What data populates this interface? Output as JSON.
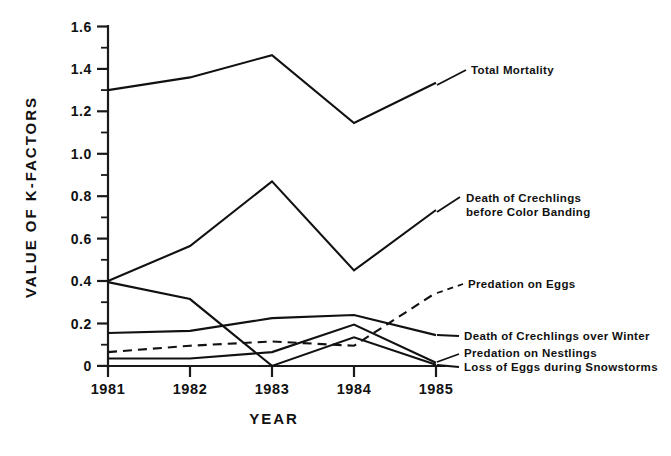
{
  "chart_data": {
    "type": "line",
    "title": "",
    "xlabel": "YEAR",
    "ylabel": "VALUE OF K-FACTORS",
    "categories": [
      "1981",
      "1982",
      "1983",
      "1984",
      "1985"
    ],
    "x": [
      1981,
      1982,
      1983,
      1984,
      1985
    ],
    "xlim": [
      1981,
      1985
    ],
    "ylim": [
      0,
      1.6
    ],
    "y_major_ticks": [
      "0",
      "0.2",
      "0.4",
      "0.6",
      "0.8",
      "1.0",
      "1.2",
      "1.4",
      "1.6"
    ],
    "y_major_values": [
      0,
      0.2,
      0.4,
      0.6,
      0.8,
      1.0,
      1.2,
      1.4,
      1.6
    ],
    "y_minor_values": [
      0.1,
      0.3,
      0.5,
      0.7,
      0.9,
      1.1,
      1.3,
      1.5
    ],
    "grid": false,
    "legend_position": "right-inline-annotations",
    "series": [
      {
        "name": "Total Mortality",
        "style": "solid",
        "label": "Total Mortality",
        "values": [
          1.3,
          1.36,
          1.465,
          1.145,
          1.335
        ]
      },
      {
        "name": "Death of Crechlings before Color Banding",
        "style": "solid",
        "label": "Death of Crechlings\nbefore Color Banding",
        "label_line1": "Death of Crechlings",
        "label_line2": "before Color Banding",
        "values": [
          0.4,
          0.565,
          0.87,
          0.45,
          0.735
        ]
      },
      {
        "name": "Loss of Eggs during Snowstorms",
        "style": "solid",
        "label": "Loss of Eggs during Snowstorms",
        "values": [
          0.395,
          0.315,
          0.0,
          0.135,
          0.005
        ]
      },
      {
        "name": "Death of Crechlings over Winter",
        "style": "solid",
        "label": "Death of Crechlings over Winter",
        "values": [
          0.155,
          0.165,
          0.225,
          0.24,
          0.145
        ]
      },
      {
        "name": "Predation on Eggs",
        "style": "dashed",
        "label": "Predation on Eggs",
        "values": [
          0.065,
          0.095,
          0.115,
          0.095,
          0.345
        ]
      },
      {
        "name": "Predation on Nestlings",
        "style": "solid",
        "label": "Predation on Nestlings",
        "values": [
          0.035,
          0.035,
          0.065,
          0.195,
          0.015
        ]
      }
    ]
  },
  "axes": {
    "y_title": "VALUE OF K-FACTORS",
    "x_title": "YEAR",
    "y_labels": [
      "1.6",
      "1.4",
      "1.2",
      "1.0",
      "0.8",
      "0.6",
      "0.4",
      "0.2",
      "0"
    ],
    "x_labels": [
      "1981",
      "1982",
      "1983",
      "1984",
      "1985"
    ]
  },
  "annotations": {
    "total_mortality": "Total Mortality",
    "crechlings_banding_l1": "Death of Crechlings",
    "crechlings_banding_l2": "before Color Banding",
    "predation_eggs": "Predation on Eggs",
    "crechlings_winter": "Death of Crechlings over Winter",
    "predation_nestlings": "Predation on Nestlings",
    "loss_eggs_snow": "Loss of Eggs during Snowstorms"
  },
  "colors": {
    "ink": "#111111",
    "background": "#ffffff"
  }
}
